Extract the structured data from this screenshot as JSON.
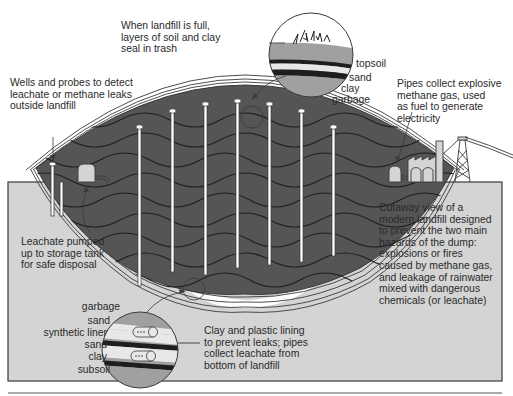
{
  "diagram": {
    "title": "Cutaway view of a modern landfill",
    "colors": {
      "ground": "#d4d4d4",
      "garbage": "#555555",
      "outline": "#3a3a3a",
      "liner_light": "#e8e8e8",
      "soil_gray": "#a0a0a0",
      "dark_band": "#1e1e1e",
      "background": "#ffffff"
    },
    "labels": {
      "cap_callout": "When landfill is full,\nlayers of soil and clay\nseal in trash",
      "wells_callout": "Wells and probes to detect\nleachate or methane leaks\noutside landfill",
      "methane_callout": "Pipes collect explosive\nmethane gas, used\nas fuel to generate\nelectricity",
      "leachate_tank_callout": "Leachate pumped\nup to storage tank\nfor safe disposal",
      "cutaway_description": "Cutaway view of a\nmodern landfill designed\nto prevent the two main\nhazards of the dump:\nexplosions or fires\ncaused by methane gas,\nand leakage of rainwater\nmixed with dangerous\nchemicals (or leachate)",
      "liner_callout": "Clay and plastic lining\nto prevent leaks; pipes\ncollect leachate from\nbottom of landfill"
    },
    "top_inset_layers": [
      "topsoil",
      "sand",
      "clay",
      "garbage"
    ],
    "bottom_inset_layers": [
      "garbage",
      "sand",
      "synthetic liner",
      "sand",
      "clay",
      "subsoil"
    ]
  }
}
